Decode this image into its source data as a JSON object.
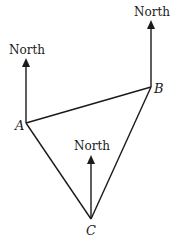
{
  "diagram": {
    "type": "bearings-triangle",
    "points": [
      {
        "id": "A",
        "label": "A",
        "x": 26,
        "y": 123
      },
      {
        "id": "B",
        "label": "B",
        "x": 151,
        "y": 87
      },
      {
        "id": "C",
        "label": "C",
        "x": 91,
        "y": 219
      }
    ],
    "edges": [
      [
        "A",
        "B"
      ],
      [
        "B",
        "C"
      ],
      [
        "C",
        "A"
      ]
    ],
    "north_arrows": [
      {
        "at": "A",
        "label": "North",
        "top_y": 60
      },
      {
        "at": "B",
        "label": "North",
        "top_y": 22
      },
      {
        "at": "C",
        "label": "North",
        "top_y": 157
      }
    ],
    "stroke_color": "#1a1a1a"
  },
  "labels": {
    "north_a": "North",
    "north_b": "North",
    "north_c": "North",
    "point_a": "A",
    "point_b": "B",
    "point_c": "C"
  }
}
